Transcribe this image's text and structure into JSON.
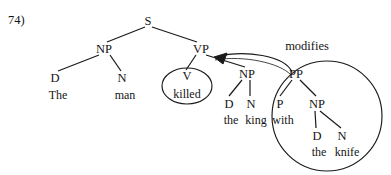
{
  "figure": {
    "item_number": "74)",
    "type": "syntax-tree",
    "sentence": "The man killed the king with the knife"
  },
  "annotation": {
    "label": "modifies",
    "from": "PP",
    "to": "VP",
    "arrow_style": "curved-filled-arrowhead"
  },
  "nodes": {
    "s": "S",
    "np_subject": "NP",
    "vp": "VP",
    "d_the_subject": "D",
    "n_man": "N",
    "v_killed": "V",
    "np_object": "NP",
    "d_the_object": "D",
    "n_king": "N",
    "pp": "PP",
    "p_with": "P",
    "np_oblique": "NP",
    "d_the_oblique": "D",
    "n_knife": "N"
  },
  "words": {
    "the_subject": "The",
    "man": "man",
    "killed": "killed",
    "the_object": "the",
    "king": "king",
    "with": "with",
    "the_oblique": "the",
    "knife": "knife"
  },
  "circles": {
    "v_ellipse": "killed-constituent-circle",
    "pp_circle": "pp-constituent-circle"
  },
  "colors": {
    "ink": "#151515",
    "line": "#1a1a1a",
    "background": "#ffffff"
  }
}
